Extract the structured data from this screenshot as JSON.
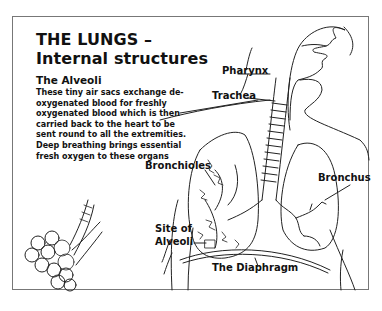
{
  "title": {
    "line1": "THE LUNGS –",
    "line2": "Internal structures"
  },
  "alveoli_section": {
    "heading": "The Alveoli",
    "description": "These tiny air sacs exchange de-oxygenated blood for freshly oxygenated blood which is then carried back to the heart to be sent round to all the extremities. Deep breathing brings essential fresh oxygen to these organs"
  },
  "labels": {
    "pharynx": "Pharynx",
    "trachea": "Trachea",
    "bronchioles": "Bronchioles",
    "bronchus": "Bronchus",
    "site_of_alveoli_1": "Site of",
    "site_of_alveoli_2": "Alveoli",
    "diaphragm": "The Diaphragm"
  }
}
